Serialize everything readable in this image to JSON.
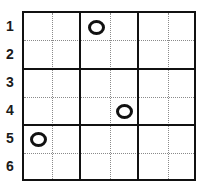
{
  "puzzle": {
    "rows": 6,
    "cols": 6,
    "box_cols": 2,
    "box_rows": 2,
    "row_labels": [
      "1",
      "2",
      "3",
      "4",
      "5",
      "6"
    ],
    "marks": [
      {
        "row": 1,
        "col": 3,
        "symbol": "circle"
      },
      {
        "row": 4,
        "col": 4,
        "symbol": "circle"
      },
      {
        "row": 5,
        "col": 1,
        "symbol": "circle"
      }
    ]
  },
  "colors": {
    "grid_line": "#111111",
    "dotted_line": "#8a8a8a",
    "mark": "#111111",
    "background": "#ffffff"
  }
}
